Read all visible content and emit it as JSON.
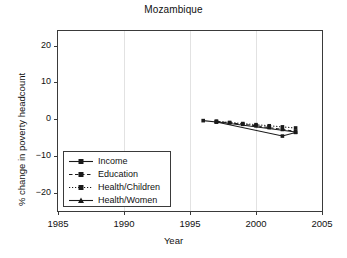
{
  "chart_data": {
    "type": "line",
    "title": "Mozambique",
    "xlabel": "Year",
    "ylabel": "% change in poverty headcount",
    "xlim": [
      1985,
      2005
    ],
    "ylim": [
      -25,
      24
    ],
    "xticks": [
      1985,
      1990,
      1995,
      2000,
      2005
    ],
    "yticks": [
      20,
      10,
      0,
      -10,
      -20
    ],
    "ytick_labels": [
      "20",
      "10",
      "0",
      "−10",
      "−20"
    ],
    "grid": "vertical-faint",
    "legend_position": "lower-left-inside",
    "series": [
      {
        "name": "Income",
        "style": "solid",
        "marker": "square",
        "x": [
          1996,
          1997,
          2002,
          2003
        ],
        "y": [
          -0.4,
          -0.8,
          -4.6,
          -3.6
        ]
      },
      {
        "name": "Education",
        "style": "dashed",
        "marker": "square",
        "x": [
          1997,
          1998,
          1999,
          2000,
          2001,
          2002,
          2003
        ],
        "y": [
          -0.6,
          -1.0,
          -1.4,
          -1.8,
          -2.3,
          -2.8,
          -3.3
        ]
      },
      {
        "name": "Health/Children",
        "style": "dotted",
        "marker": "square",
        "x": [
          1997,
          1998,
          1999,
          2000,
          2001,
          2002,
          2003
        ],
        "y": [
          -0.6,
          -0.9,
          -1.2,
          -1.5,
          -1.8,
          -2.1,
          -2.4
        ]
      },
      {
        "name": "Health/Women",
        "style": "solid",
        "marker": "triangle",
        "x": [
          1997,
          2003
        ],
        "y": [
          -0.7,
          -3.5
        ]
      }
    ]
  },
  "legend": {
    "items": [
      {
        "label": "Income"
      },
      {
        "label": "Education"
      },
      {
        "label": "Health/Children"
      },
      {
        "label": "Health/Women"
      }
    ]
  },
  "colors": {
    "line": "#1a1a1a",
    "axis": "#3a3a3a",
    "grid": "#e2e2e2",
    "background": "#ffffff"
  }
}
